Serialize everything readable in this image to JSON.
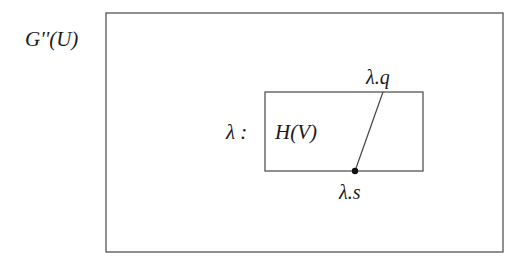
{
  "diagram": {
    "outer_box": {
      "label": "G''(U)",
      "x": 106,
      "y": 13,
      "width": 397,
      "height": 239
    },
    "inner_box": {
      "label": "H(V)",
      "prefix": "λ :",
      "x": 265,
      "y": 92,
      "width": 158,
      "height": 79
    },
    "segment": {
      "top_label": "λ.q",
      "bottom_label": "λ.s",
      "x1": 383,
      "y1": 92,
      "x2": 355,
      "y2": 171
    },
    "stroke_color": "#555555"
  }
}
